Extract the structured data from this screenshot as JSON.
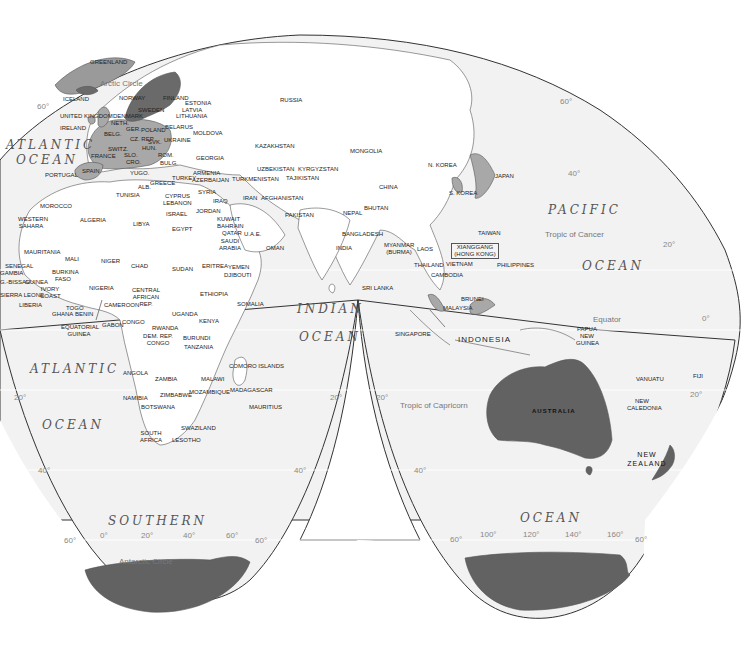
{
  "map": {
    "projection": "Goode homolosine (interrupted)",
    "colors": {
      "ocean_fill": "#f2f2f2",
      "land_default": "#ffffff",
      "highlight_medium": "#a8a8a8",
      "highlight_dark": "#6a6a6a",
      "antarctica": "#626262",
      "border_line": "#333333"
    },
    "oceans": [
      {
        "id": "atlantic-north-1",
        "text": "ATLANTIC"
      },
      {
        "id": "atlantic-north-2",
        "text": "OCEAN"
      },
      {
        "id": "atlantic-south-1",
        "text": "ATLANTIC"
      },
      {
        "id": "atlantic-south-2",
        "text": "OCEAN"
      },
      {
        "id": "pacific-1",
        "text": "PACIFIC"
      },
      {
        "id": "pacific-2",
        "text": "OCEAN"
      },
      {
        "id": "indian-1",
        "text": "INDIAN"
      },
      {
        "id": "indian-2",
        "text": "OCEAN"
      },
      {
        "id": "southern-1",
        "text": "SOUTHERN"
      },
      {
        "id": "southern-2",
        "text": "OCEAN"
      }
    ],
    "reference_lines": {
      "arctic_circle": "Arctic Circle",
      "tropic_of_cancer": "Tropic of Cancer",
      "equator": "Equator",
      "tropic_of_capricorn": "Tropic of Capricorn",
      "antarctic_circle": "Antarctic Circle"
    },
    "graticule_labels": {
      "lat_60_nw": "60°",
      "lat_60_ne": "60°",
      "lat_40_ne": "40°",
      "lat_20_ne": "20°",
      "lat_0_e": "0°",
      "lat_20_e": "20°",
      "lat_20_sw": "20°",
      "lat_20_sc1": "20°",
      "lat_20_sc2": "20°",
      "lat_40_sw": "40°",
      "lat_40_sc": "40°",
      "lat_40_se": "40°",
      "lat_60_sw": "60°",
      "lat_60_sc": "60°",
      "lat_60_sc2": "60°",
      "lat_60_se": "60°",
      "lon_0": "0°",
      "lon_20": "20°",
      "lon_40": "40°",
      "lon_60": "60°",
      "lon_100": "100°",
      "lon_120": "120°",
      "lon_140": "140°",
      "lon_160": "160°"
    },
    "countries": {
      "greenland": "GREENLAND",
      "iceland": "ICELAND",
      "norway": "NORWAY",
      "sweden": "SWEDEN",
      "finland": "FINLAND",
      "estonia": "ESTONIA",
      "latvia": "LATVIA",
      "lithuania": "LITHUANIA",
      "united_kingdom": "UNITED KINGDOM",
      "ireland": "IRELAND",
      "denmark": "DENMARK",
      "neth": "NETH.",
      "belg": "BELG.",
      "ger": "GER.",
      "poland": "POLAND",
      "belarus": "BELARUS",
      "cz_rep": "CZ. REP.",
      "svk": "SVK.",
      "hun": "HUN.",
      "ukraine": "UKRAINE",
      "moldova": "MOLDOVA",
      "switz": "SWITZ.",
      "slo": "SLO.",
      "cro": "CRO.",
      "rom": "ROM.",
      "bulg": "BULG.",
      "yugo": "YUGO.",
      "alb": "ALB.",
      "mac": "MAC.",
      "greece": "GREECE",
      "france": "FRANCE",
      "spain": "SPAIN",
      "portugal": "PORTUGAL",
      "italy": "ITALY",
      "turkey": "TURKEY",
      "georgia": "GEORGIA",
      "armenia": "ARMENIA",
      "azerbaijan": "AZERBAIJAN",
      "russia": "RUSSIA",
      "kazakhstan": "KAZAKHSTAN",
      "mongolia": "MONGOLIA",
      "uzbekistan": "UZBEKISTAN",
      "kyrgyzstan": "KYRGYZSTAN",
      "turkmenistan": "TURKMENISTAN",
      "tajikistan": "TAJIKISTAN",
      "china": "CHINA",
      "n_korea": "N. KOREA",
      "s_korea": "S. KOREA",
      "japan": "JAPAN",
      "taiwan": "TAIWAN",
      "hong_kong": "XIANGGANG (HONG KONG)",
      "philippines": "PHILIPPINES",
      "myanmar": "MYANMAR (BURMA)",
      "laos": "LAOS",
      "thailand": "THAILAND",
      "vietnam": "VIETNAM",
      "cambodia": "CAMBODIA",
      "malaysia": "MALAYSIA",
      "brunei": "BRUNEI",
      "singapore": "SINGAPORE",
      "indonesia": "INDONESIA",
      "papua_new_guinea": "PAPUA NEW GUINEA",
      "australia": "AUSTRALIA",
      "new_zealand": "NEW ZEALAND",
      "vanuatu": "VANUATU",
      "new_caledonia": "NEW CALEDONIA",
      "fiji": "FIJI",
      "india": "INDIA",
      "nepal": "NEPAL",
      "bhutan": "BHUTAN",
      "bangladesh": "BANGLADESH",
      "sri_lanka": "SRI LANKA",
      "pakistan": "PAKISTAN",
      "afghanistan": "AFGHANISTAN",
      "iran": "IRAN",
      "iraq": "IRAQ",
      "syria": "SYRIA",
      "cyprus": "CYPRUS",
      "lebanon": "LEBANON",
      "israel": "ISRAEL",
      "jordan": "JORDAN",
      "kuwait": "KUWAIT",
      "bahrain": "BAHRAIN",
      "qatar": "QATAR",
      "uae": "U.A.E.",
      "saudi_arabia": "SAUDI ARABIA",
      "oman": "OMAN",
      "yemen": "YEMEN",
      "djibouti": "DJIBOUTI",
      "eritrea": "ERITREA",
      "ethiopia": "ETHIOPIA",
      "somalia": "SOMALIA",
      "tunisia": "TUNISIA",
      "morocco": "MOROCCO",
      "western_sahara": "WESTERN SAHARA",
      "algeria": "ALGERIA",
      "libya": "LIBYA",
      "egypt": "EGYPT",
      "mauritania": "MAURITANIA",
      "mali": "MALI",
      "niger": "NIGER",
      "chad": "CHAD",
      "sudan": "SUDAN",
      "senegal": "SENEGAL",
      "gambia": "GAMBIA",
      "guinea_bissau": "G.-BISSAU",
      "guinea": "GUINEA",
      "sierra_leone": "SIERRA LEONE",
      "liberia": "LIBERIA",
      "burkina_faso": "BURKINA FASO",
      "ivory_coast": "IVORY COAST",
      "ghana": "GHANA",
      "togo": "TOGO",
      "benin": "BENIN",
      "nigeria": "NIGERIA",
      "cameroon": "CAMEROON",
      "central_african_rep": "CENTRAL AFRICAN REP.",
      "equatorial_guinea": "EQUATORIAL GUINEA",
      "gabon": "GABON",
      "congo": "CONGO",
      "dem_rep_congo": "DEM. REP. CONGO",
      "uganda": "UGANDA",
      "kenya": "KENYA",
      "rwanda": "RWANDA",
      "burundi": "BURUNDI",
      "tanzania": "TANZANIA",
      "angola": "ANGOLA",
      "zambia": "ZAMBIA",
      "malawi": "MALAWI",
      "mozambique": "MOZAMBIQUE",
      "zimbabwe": "ZIMBABWE",
      "namibia": "NAMIBIA",
      "botswana": "BOTSWANA",
      "south_africa": "SOUTH AFRICA",
      "swaziland": "SWAZILAND",
      "lesotho": "LESOTHO",
      "madagascar": "MADAGASCAR",
      "comoro_islands": "COMORO ISLANDS",
      "mauritius": "MAURITIUS"
    }
  }
}
